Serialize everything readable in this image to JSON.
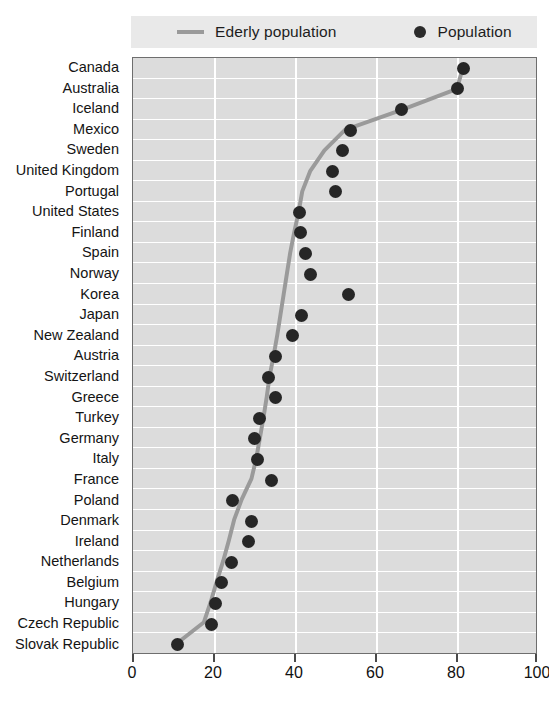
{
  "legend": {
    "items": [
      {
        "label": "Ederly population",
        "marker": "line-swatch",
        "color": "#9a9a9a"
      },
      {
        "label": "Population",
        "marker": "dot-swatch",
        "color": "#2b2b2b"
      }
    ]
  },
  "axis": {
    "x_ticks": [
      "0",
      "20",
      "40",
      "60",
      "80",
      "100"
    ]
  },
  "colors": {
    "plot_background": "#dcdcdc",
    "legend_background": "#e9e9e9",
    "gridline": "#ffffff",
    "marker": "#262626",
    "line": "#9a9a9a",
    "axis": "#6e6e6e",
    "text": "#141414"
  },
  "chart_data": {
    "type": "scatter",
    "title": "",
    "subtitle": "",
    "xlabel": "",
    "ylabel": "",
    "orientation": "horizontal",
    "xlim": [
      0,
      100
    ],
    "xticks": [
      0,
      20,
      40,
      60,
      80,
      100
    ],
    "grid": true,
    "legend_position": "top",
    "categories": [
      "Canada",
      "Australia",
      "Iceland",
      "Mexico",
      "Sweden",
      "United Kingdom",
      "Portugal",
      "United States",
      "Finland",
      "Spain",
      "Norway",
      "Korea",
      "Japan",
      "New Zealand",
      "Austria",
      "Switzerland",
      "Greece",
      "Turkey",
      "Germany",
      "Italy",
      "France",
      "Poland",
      "Denmark",
      "Ireland",
      "Netherlands",
      "Belgium",
      "Hungary",
      "Czech Republic",
      "Slovak Republic"
    ],
    "series": [
      {
        "name": "Population",
        "type": "scatter",
        "marker": "circle",
        "color": "#262626",
        "values": [
          81.6,
          80.2,
          66.2,
          53.8,
          51.8,
          49.2,
          50.1,
          41.1,
          41.4,
          42.6,
          43.8,
          53.1,
          41.6,
          39.4,
          35.1,
          33.4,
          35.3,
          31.2,
          30.0,
          30.8,
          34.1,
          24.5,
          29.2,
          28.6,
          24.3,
          21.9,
          20.4,
          19.4,
          11.1
        ]
      },
      {
        "name": "Ederly population",
        "type": "line",
        "color": "#9a9a9a",
        "values": [
          81.8,
          80.4,
          67.0,
          52.6,
          47.5,
          44.0,
          42.0,
          41.1,
          40.0,
          39.0,
          38.2,
          37.4,
          36.6,
          35.8,
          34.9,
          33.9,
          33.2,
          32.4,
          31.5,
          30.6,
          29.4,
          27.0,
          25.1,
          23.8,
          22.4,
          20.8,
          19.3,
          17.6,
          11.1
        ]
      }
    ]
  }
}
